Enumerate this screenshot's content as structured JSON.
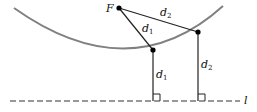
{
  "diagram": {
    "focus": {
      "label": "F",
      "x": 119,
      "y": 8
    },
    "points": [
      {
        "name": "P1",
        "x": 153,
        "y": 50
      },
      {
        "name": "P2",
        "x": 198,
        "y": 32
      }
    ],
    "directrix": {
      "label": "l",
      "y": 101
    },
    "labels": {
      "d1_slant": {
        "base": "d",
        "sub": "1"
      },
      "d2_slant": {
        "base": "d",
        "sub": "2"
      },
      "d1_vertical": {
        "base": "d",
        "sub": "1"
      },
      "d2_vertical": {
        "base": "d",
        "sub": "2"
      }
    },
    "colors": {
      "parabola": "#808080",
      "lines": "#222222",
      "points": "#000000"
    }
  }
}
